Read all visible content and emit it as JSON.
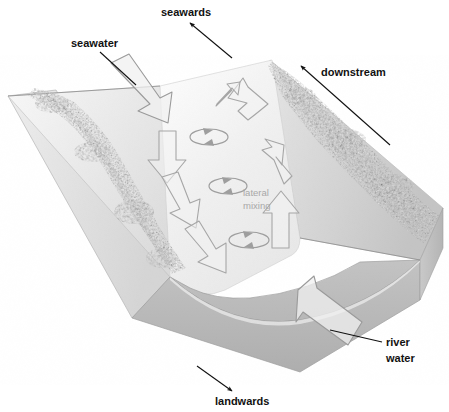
{
  "figure": {
    "type": "block-diagram",
    "background_color": "#ffffff"
  },
  "labels": {
    "seawards": "seawards",
    "seawater": "seawater",
    "downstream": "downstream",
    "river_water_line1": "river",
    "river_water_line2": "water",
    "landwards": "landwards",
    "lateral_mixing_line1": "lateral",
    "lateral_mixing_line2": "mixing"
  },
  "colors": {
    "label_text": "#111111",
    "soft_label_text": "#a8a8a8",
    "leader_line": "#111111",
    "arrow_fill": "#f0f0f0",
    "arrow_stroke": "#9e9e9e",
    "block_top_left": "#ececec",
    "block_front_face": "#b9b9b9",
    "block_side_face": "#dcdcdc",
    "water_surface": "#efefef",
    "bank_vegetation": "#7a7a7a"
  },
  "elements": {
    "block": "isometric cut-away block of an estuary channel",
    "water_surface": "pale channel water surface running from lower-right to upper-left",
    "left_bank": "mottled dark vegetated left bank",
    "right_bank": "mottled dark vegetated right bank",
    "front_face": "curved channel cross-section on the front face of the block"
  },
  "flow_arrows": [
    {
      "name": "seawater-inflow-arrow",
      "direction": "down-right",
      "meaning": "seawater entering landwards"
    },
    {
      "name": "river-water-inflow-arrow",
      "direction": "up-left",
      "meaning": "river water flowing seawards"
    },
    {
      "name": "left-flow-arrow-1",
      "direction": "down",
      "meaning": "seaward-side down-channel flow"
    },
    {
      "name": "left-flow-arrow-2",
      "direction": "down-right",
      "meaning": "seaward-side down-channel flow"
    },
    {
      "name": "left-flow-arrow-3",
      "direction": "down-right",
      "meaning": "seaward-side down-channel flow"
    },
    {
      "name": "right-flow-arrow-1",
      "direction": "up-left",
      "meaning": "landward-side up-channel flow"
    },
    {
      "name": "right-flow-arrow-2",
      "direction": "up-left",
      "meaning": "landward-side up-channel flow"
    },
    {
      "name": "right-flow-arrow-3",
      "direction": "up",
      "meaning": "landward-side up-channel flow"
    }
  ],
  "mixing_loops": [
    {
      "name": "mixing-loop-1",
      "label": null
    },
    {
      "name": "mixing-loop-2",
      "label": "lateral mixing"
    },
    {
      "name": "mixing-loop-3",
      "label": null
    }
  ],
  "direction_indicators": [
    {
      "name": "seawards-indicator",
      "label": "seawards",
      "arrow_points": "up-left"
    },
    {
      "name": "downstream-indicator",
      "label": "downstream",
      "arrow_points": "up-left"
    },
    {
      "name": "landwards-indicator",
      "label": "landwards",
      "arrow_points": "down-right"
    },
    {
      "name": "seawater-indicator",
      "label": "seawater",
      "arrow_points": "down-right"
    },
    {
      "name": "river-water-indicator",
      "label": "river water",
      "arrow_points": "up-left"
    }
  ]
}
